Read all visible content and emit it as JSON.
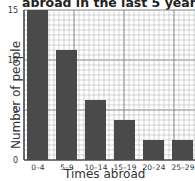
{
  "chart_data": {
    "type": "bar",
    "title": "abroad in the last 5 years",
    "xlabel": "Times abroad",
    "ylabel": "Number of people",
    "categories": [
      "0–4",
      "5–9",
      "10–14",
      "15–19",
      "20–24",
      "25–29"
    ],
    "values": [
      15,
      11,
      6,
      4,
      2,
      2
    ],
    "ylim": [
      0,
      15
    ],
    "yticks": [
      "0",
      "5",
      "10",
      "15"
    ],
    "grid": true,
    "legend": null
  },
  "colors": {
    "bar": "#4a4a4a",
    "grid": "#999999"
  }
}
